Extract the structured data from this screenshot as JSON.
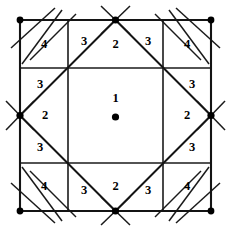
{
  "figure": {
    "background_color": "#ffffff",
    "line_color": "#141414",
    "dot_color": "#000000",
    "width": 235,
    "height": 233
  },
  "geometry": {
    "outer_square": {
      "left": 20,
      "top": 20,
      "right": 211,
      "bottom": 211
    },
    "grid_offsets": {
      "near": 68,
      "far": 163
    },
    "midpoints": {
      "x": 115.5,
      "y": 115.5
    }
  },
  "labels": [
    {
      "id": "center",
      "text": "1",
      "x": 115.5,
      "y": 99
    },
    {
      "id": "top-inner",
      "text": "2",
      "x": 115.5,
      "y": 45
    },
    {
      "id": "left-inner",
      "text": "2",
      "x": 45,
      "y": 116
    },
    {
      "id": "right-inner",
      "text": "2",
      "x": 187,
      "y": 116
    },
    {
      "id": "bottom-inner",
      "text": "2",
      "x": 115.5,
      "y": 187
    },
    {
      "id": "top-left-3",
      "text": "3",
      "x": 84,
      "y": 42
    },
    {
      "id": "top-right-3",
      "text": "3",
      "x": 148,
      "y": 42
    },
    {
      "id": "left-top-3",
      "text": "3",
      "x": 40,
      "y": 85
    },
    {
      "id": "left-bottom-3",
      "text": "3",
      "x": 40,
      "y": 148
    },
    {
      "id": "right-top-3",
      "text": "3",
      "x": 192,
      "y": 85
    },
    {
      "id": "right-bottom-3",
      "text": "3",
      "x": 192,
      "y": 148
    },
    {
      "id": "bottom-left-3",
      "text": "3",
      "x": 84,
      "y": 191
    },
    {
      "id": "bottom-right-3",
      "text": "3",
      "x": 148,
      "y": 191
    },
    {
      "id": "corner-tl-4",
      "text": "4",
      "x": 44,
      "y": 45
    },
    {
      "id": "corner-tr-4",
      "text": "4",
      "x": 187,
      "y": 45
    },
    {
      "id": "corner-bl-4",
      "text": "4",
      "x": 44,
      "y": 187
    },
    {
      "id": "corner-br-4",
      "text": "4",
      "x": 187,
      "y": 187
    }
  ],
  "dots": [
    {
      "id": "dot-center",
      "x": 115.5,
      "y": 117,
      "r": 3.6
    },
    {
      "id": "dot-corner-tl",
      "x": 20,
      "y": 20,
      "r": 3.4
    },
    {
      "id": "dot-corner-tr",
      "x": 211,
      "y": 20,
      "r": 3.4
    },
    {
      "id": "dot-corner-bl",
      "x": 20,
      "y": 211,
      "r": 3.4
    },
    {
      "id": "dot-corner-br",
      "x": 211,
      "y": 211,
      "r": 3.4
    },
    {
      "id": "dot-mid-top",
      "x": 115.5,
      "y": 20,
      "r": 3.6
    },
    {
      "id": "dot-mid-bottom",
      "x": 115.5,
      "y": 211,
      "r": 3.6
    },
    {
      "id": "dot-mid-left",
      "x": 20,
      "y": 115.5,
      "r": 3.6
    },
    {
      "id": "dot-mid-right",
      "x": 211,
      "y": 115.5,
      "r": 3.6
    }
  ],
  "outer_square_edges": [
    {
      "id": "edge-top",
      "x1": 20,
      "y1": 20,
      "x2": 211,
      "y2": 20
    },
    {
      "id": "edge-right",
      "x1": 211,
      "y1": 20,
      "x2": 211,
      "y2": 211
    },
    {
      "id": "edge-bottom",
      "x1": 20,
      "y1": 211,
      "x2": 211,
      "y2": 211
    },
    {
      "id": "edge-left",
      "x1": 20,
      "y1": 20,
      "x2": 20,
      "y2": 211
    }
  ],
  "grid_lines": [
    {
      "id": "grid-h-near",
      "x1": 20,
      "y1": 68,
      "x2": 211,
      "y2": 68
    },
    {
      "id": "grid-h-far",
      "x1": 20,
      "y1": 163,
      "x2": 211,
      "y2": 163
    },
    {
      "id": "grid-v-near",
      "x1": 68,
      "y1": 20,
      "x2": 68,
      "y2": 211
    },
    {
      "id": "grid-v-far",
      "x1": 163,
      "y1": 20,
      "x2": 163,
      "y2": 211
    }
  ],
  "diamond_edges": [
    {
      "id": "diamond-tl",
      "x1": 115.5,
      "y1": 20,
      "x2": 20,
      "y2": 115.5
    },
    {
      "id": "diamond-tr",
      "x1": 115.5,
      "y1": 20,
      "x2": 211,
      "y2": 115.5
    },
    {
      "id": "diamond-bl",
      "x1": 20,
      "y1": 115.5,
      "x2": 115.5,
      "y2": 211
    },
    {
      "id": "diamond-br",
      "x1": 211,
      "y1": 115.5,
      "x2": 115.5,
      "y2": 211
    }
  ],
  "external_segments": [
    {
      "id": "ext-mid-top-a",
      "x1": 101,
      "y1": 6,
      "x2": 130,
      "y2": 34
    },
    {
      "id": "ext-mid-top-b",
      "x1": 130,
      "y1": 6,
      "x2": 101,
      "y2": 34
    },
    {
      "id": "ext-mid-bottom-a",
      "x1": 101,
      "y1": 197,
      "x2": 130,
      "y2": 225
    },
    {
      "id": "ext-mid-bottom-b",
      "x1": 130,
      "y1": 197,
      "x2": 101,
      "y2": 225
    },
    {
      "id": "ext-mid-left-a",
      "x1": 6,
      "y1": 101,
      "x2": 34,
      "y2": 130
    },
    {
      "id": "ext-mid-left-b",
      "x1": 6,
      "y1": 130,
      "x2": 34,
      "y2": 101
    },
    {
      "id": "ext-mid-right-a",
      "x1": 197,
      "y1": 101,
      "x2": 225,
      "y2": 130
    },
    {
      "id": "ext-mid-right-b",
      "x1": 197,
      "y1": 130,
      "x2": 225,
      "y2": 101
    },
    {
      "id": "ext-tl-1",
      "x1": 11,
      "y1": 48,
      "x2": 55,
      "y2": 8
    },
    {
      "id": "ext-tl-2",
      "x1": 30,
      "y1": 60,
      "x2": 76,
      "y2": 14
    },
    {
      "id": "ext-tl-3",
      "x1": 22,
      "y1": 64,
      "x2": 62,
      "y2": 10
    },
    {
      "id": "ext-tr-1",
      "x1": 220,
      "y1": 48,
      "x2": 176,
      "y2": 8
    },
    {
      "id": "ext-tr-2",
      "x1": 201,
      "y1": 60,
      "x2": 155,
      "y2": 14
    },
    {
      "id": "ext-tr-3",
      "x1": 209,
      "y1": 64,
      "x2": 169,
      "y2": 10
    },
    {
      "id": "ext-bl-1",
      "x1": 11,
      "y1": 183,
      "x2": 55,
      "y2": 223
    },
    {
      "id": "ext-bl-2",
      "x1": 30,
      "y1": 171,
      "x2": 76,
      "y2": 217
    },
    {
      "id": "ext-bl-3",
      "x1": 22,
      "y1": 167,
      "x2": 62,
      "y2": 221
    },
    {
      "id": "ext-br-1",
      "x1": 220,
      "y1": 183,
      "x2": 176,
      "y2": 223
    },
    {
      "id": "ext-br-2",
      "x1": 201,
      "y1": 171,
      "x2": 155,
      "y2": 217
    },
    {
      "id": "ext-br-3",
      "x1": 209,
      "y1": 167,
      "x2": 169,
      "y2": 221
    }
  ]
}
